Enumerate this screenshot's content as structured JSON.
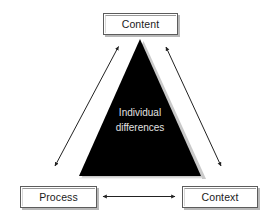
{
  "diagram": {
    "title_text": "",
    "nodes": [
      {
        "id": "content",
        "label": "Content",
        "icon": "rectangle-node-icon"
      },
      {
        "id": "process",
        "label": "Process",
        "icon": "rectangle-node-icon"
      },
      {
        "id": "context",
        "label": "Context",
        "icon": "rectangle-node-icon"
      }
    ],
    "center": {
      "shape": "triangle",
      "line1": "Individual",
      "line2": "differences",
      "fill_color": "#000000",
      "shadow_color": "#c9c9c9",
      "text_color": "#e2e2e2"
    },
    "connectors": [
      {
        "id": "content-process",
        "style": "double-arrow",
        "icon": "double-arrow-icon",
        "from": "content",
        "to": "process"
      },
      {
        "id": "content-context",
        "style": "double-arrow",
        "icon": "double-arrow-icon",
        "from": "content",
        "to": "context"
      },
      {
        "id": "process-context",
        "style": "double-arrow",
        "icon": "double-arrow-icon",
        "from": "process",
        "to": "context"
      }
    ],
    "colors": {
      "box_border": "#5c5c5c",
      "box_fill": "#ffffff",
      "box_shadow": "#b8b8b8",
      "arrow": "#222222",
      "background": "#ffffff"
    }
  }
}
